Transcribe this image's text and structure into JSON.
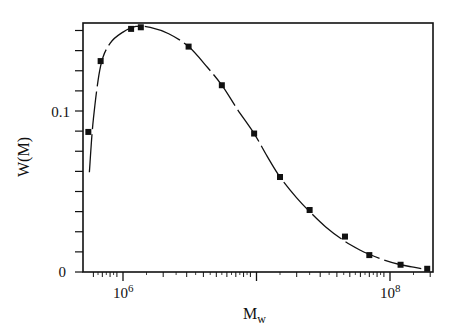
{
  "chart_data": {
    "type": "line",
    "title": "",
    "xlabel": "M",
    "xlabel_subscript": "w",
    "ylabel": "W(M)",
    "xscale": "log",
    "xlim": [
      530000.0,
      230000000.0
    ],
    "ylim": [
      0,
      0.155
    ],
    "x_tick_labels": [
      {
        "base": "10",
        "exp": "6",
        "value": 1000000
      },
      {
        "base": "10",
        "exp": "8",
        "value": 100000000
      }
    ],
    "y_tick_labels": [
      {
        "label": "0",
        "value": 0
      },
      {
        "label": "0.1",
        "value": 0.1
      }
    ],
    "y_minor_tick_step": 0.0125,
    "grid": false,
    "legend": null,
    "series": [
      {
        "name": "data points",
        "marker": "square",
        "x": [
          550000,
          680000,
          1150000,
          1360000,
          3100000,
          5500000,
          9600000,
          15000000,
          25000000,
          46000000,
          70000000,
          120000000,
          190000000
        ],
        "values": [
          0.087,
          0.131,
          0.151,
          0.152,
          0.14,
          0.116,
          0.086,
          0.059,
          0.0385,
          0.022,
          0.0105,
          0.0045,
          0.002
        ]
      },
      {
        "name": "fitted curve",
        "style": "dashed-line",
        "x": [
          560000,
          600000,
          680000,
          800000,
          1000000,
          1250000,
          1600000,
          2200000,
          3100000,
          4300000,
          5500000,
          7200000,
          9600000,
          12000000,
          15000000,
          20000000,
          25000000,
          33000000,
          46000000,
          60000000,
          70000000,
          90000000,
          120000000,
          150000000,
          190000000
        ],
        "values": [
          0.062,
          0.095,
          0.128,
          0.142,
          0.149,
          0.1525,
          0.152,
          0.148,
          0.14,
          0.127,
          0.116,
          0.101,
          0.086,
          0.072,
          0.059,
          0.046,
          0.0375,
          0.028,
          0.019,
          0.0135,
          0.011,
          0.0075,
          0.0045,
          0.003,
          0.0015
        ]
      }
    ]
  },
  "colors": {
    "ink": "#111111",
    "background": "#ffffff"
  }
}
